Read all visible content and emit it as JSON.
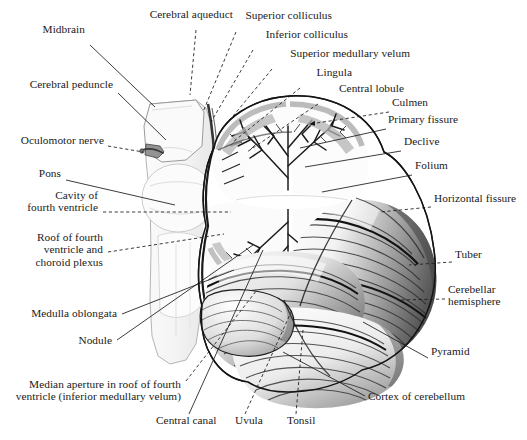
{
  "figure": {
    "background_color": "#ffffff",
    "ink_color": "#1a1a1a",
    "style": "grayscale anatomical engraving"
  },
  "labels": [
    {
      "id": "midbrain",
      "text": "Midbrain",
      "x": 85,
      "y": 33,
      "align": "right"
    },
    {
      "id": "cerebral-aqueduct",
      "text": "Cerebral aqueduct",
      "x": 233,
      "y": 18,
      "align": "right"
    },
    {
      "id": "superior-colliculus",
      "text": "Superior colliculus",
      "x": 332,
      "y": 19,
      "align": "right"
    },
    {
      "id": "inferior-colliculus",
      "text": "Inferior colliculus",
      "x": 348,
      "y": 38,
      "align": "right"
    },
    {
      "id": "superior-medullary-velum",
      "text": "Superior medullary velum",
      "x": 410,
      "y": 57,
      "align": "right"
    },
    {
      "id": "lingula",
      "text": "Lingula",
      "x": 352,
      "y": 76,
      "align": "right"
    },
    {
      "id": "central-lobule",
      "text": "Central lobule",
      "x": 404,
      "y": 92,
      "align": "right"
    },
    {
      "id": "culmen",
      "text": "Culmen",
      "x": 392,
      "y": 106,
      "align": "left"
    },
    {
      "id": "primary-fissure",
      "text": "Primary fissure",
      "x": 388,
      "y": 123,
      "align": "left"
    },
    {
      "id": "declive",
      "text": "Declive",
      "x": 404,
      "y": 145,
      "align": "left"
    },
    {
      "id": "folium",
      "text": "Folium",
      "x": 415,
      "y": 169,
      "align": "left"
    },
    {
      "id": "horizontal-fissure",
      "text": "Horizontal fissure",
      "x": 434,
      "y": 202,
      "align": "left"
    },
    {
      "id": "tuber",
      "text": "Tuber",
      "x": 455,
      "y": 258,
      "align": "left"
    },
    {
      "id": "cerebellar-hemisphere",
      "text": "Cerebellar\nhemisphere",
      "x": 448,
      "y": 293,
      "align": "left"
    },
    {
      "id": "pyramid",
      "text": "Pyramid",
      "x": 431,
      "y": 355,
      "align": "left"
    },
    {
      "id": "cortex-of-cerebellum",
      "text": "Cortex of cerebellum",
      "x": 368,
      "y": 400,
      "align": "left"
    },
    {
      "id": "cerebral-peduncle",
      "text": "Cerebral peduncle",
      "x": 113,
      "y": 88,
      "align": "right"
    },
    {
      "id": "oculomotor-nerve",
      "text": "Oculomotor nerve",
      "x": 104,
      "y": 144,
      "align": "right"
    },
    {
      "id": "pons",
      "text": "Pons",
      "x": 61,
      "y": 177,
      "align": "right"
    },
    {
      "id": "cavity-of-fourth-ventricle",
      "text": "Cavity of\nfourth ventricle",
      "x": 98,
      "y": 199,
      "align": "right"
    },
    {
      "id": "roof-of-fourth-ventricle",
      "text": "Roof of fourth\nventricle and\nchoroid plexus",
      "x": 103,
      "y": 241,
      "align": "right"
    },
    {
      "id": "medulla-oblongata",
      "text": "Medulla oblongata",
      "x": 117,
      "y": 317,
      "align": "right"
    },
    {
      "id": "nodule",
      "text": "Nodule",
      "x": 112,
      "y": 344,
      "align": "right"
    },
    {
      "id": "median-aperture",
      "text": "Median aperture in roof of fourth\nventricle (inferior medullary velum)",
      "x": 181,
      "y": 388,
      "align": "right"
    },
    {
      "id": "central-canal",
      "text": "Central canal",
      "x": 156,
      "y": 424,
      "align": "left"
    },
    {
      "id": "uvula",
      "text": "Uvula",
      "x": 235,
      "y": 424,
      "align": "left"
    },
    {
      "id": "tonsil",
      "text": "Tonsil",
      "x": 287,
      "y": 424,
      "align": "left"
    }
  ],
  "leader_lines": [
    {
      "id": "midbrain",
      "dashed": false,
      "points": "90,45 155,107"
    },
    {
      "id": "cerebral-aqueduct",
      "dashed": true,
      "points": "196,30 190,95"
    },
    {
      "id": "superior-colliculus",
      "dashed": true,
      "points": "236,32 203,112"
    },
    {
      "id": "inferior-colliculus",
      "dashed": true,
      "points": "253,50 211,122"
    },
    {
      "id": "superior-medullary-velum",
      "dashed": true,
      "points": "272,69 219,133"
    },
    {
      "id": "lingula",
      "dashed": true,
      "points": "300,88 233,142"
    },
    {
      "id": "central-lobule",
      "dashed": true,
      "points": "318,104 247,152"
    },
    {
      "id": "culmen",
      "dashed": true,
      "points": "389,112 310,124",
      "arrow": true
    },
    {
      "id": "primary-fissure",
      "dashed": false,
      "points": "386,129 300,148"
    },
    {
      "id": "declive",
      "dashed": false,
      "points": "401,151 305,167"
    },
    {
      "id": "folium",
      "dashed": false,
      "points": "412,175 322,192"
    },
    {
      "id": "horizontal-fissure",
      "dashed": true,
      "points": "431,207 380,212"
    },
    {
      "id": "tuber",
      "dashed": true,
      "points": "452,262 409,265"
    },
    {
      "id": "cerebellar-hemisphere",
      "dashed": true,
      "points": "445,299 400,300"
    },
    {
      "id": "pyramid",
      "dashed": false,
      "points": "428,358 363,322"
    },
    {
      "id": "cortex-of-cerebellum",
      "dashed": false,
      "points": "365,396 283,352"
    },
    {
      "id": "cerebral-peduncle",
      "dashed": false,
      "points": "118,93 166,140"
    },
    {
      "id": "oculomotor-nerve",
      "dashed": true,
      "points": "108,146 143,152"
    },
    {
      "id": "pons",
      "dashed": false,
      "points": "66,180 175,205"
    },
    {
      "id": "cavity-of-fourth-ventricle",
      "dashed": true,
      "points": "103,212 231,212"
    },
    {
      "id": "roof-of-fourth-ventricle",
      "dashed": true,
      "points": "108,252 224,234"
    },
    {
      "id": "medulla-oblongata",
      "dashed": false,
      "points": "122,314 234,270"
    },
    {
      "id": "nodule",
      "dashed": false,
      "points": "117,340 253,245"
    },
    {
      "id": "median-aperture",
      "dashed": true,
      "points": "186,381 257,290"
    },
    {
      "id": "central-canal",
      "dashed": false,
      "points": "189,414 263,250"
    },
    {
      "id": "uvula",
      "dashed": true,
      "points": "245,414 292,310"
    },
    {
      "id": "tonsil",
      "dashed": true,
      "points": "296,414 303,330"
    }
  ]
}
